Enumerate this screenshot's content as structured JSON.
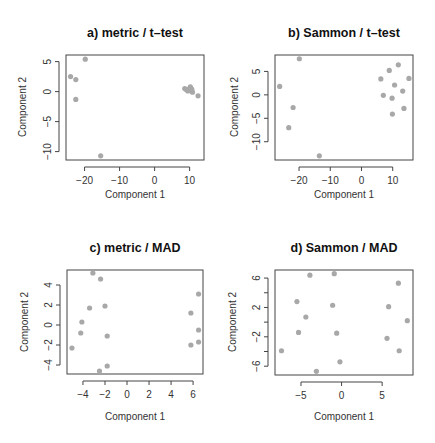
{
  "figure": {
    "background": "#ffffff",
    "point_color": "#a8a8a8",
    "axis_color": "#444444"
  },
  "chart_data": [
    {
      "type": "scatter",
      "title": "a) metric / t–test",
      "xlabel": "Component 1",
      "ylabel": "Component 2",
      "xticks": [
        -20,
        -10,
        0,
        10
      ],
      "xtick_labels": [
        "−20",
        "−10",
        "0",
        "10"
      ],
      "yticks": [
        5,
        0,
        -5,
        -10
      ],
      "ytick_labels": [
        "5",
        "0",
        "−5",
        "−10"
      ],
      "xlim": [
        -25.3,
        14.1
      ],
      "ylim": [
        -11.4,
        6.1
      ],
      "grid": false,
      "legend": null,
      "box": {
        "left": 66,
        "top": 55,
        "right": 204,
        "bottom": 160
      },
      "points": [
        {
          "x": -19.8,
          "y": 5.4
        },
        {
          "x": -24.0,
          "y": 2.5
        },
        {
          "x": -22.5,
          "y": 2.0
        },
        {
          "x": -22.5,
          "y": -1.3
        },
        {
          "x": -15.4,
          "y": -10.7
        },
        {
          "x": 8.6,
          "y": 0.5
        },
        {
          "x": 9.5,
          "y": 0.1
        },
        {
          "x": 10.2,
          "y": 0.8
        },
        {
          "x": 10.6,
          "y": 0.4
        },
        {
          "x": 9.8,
          "y": 0.4
        },
        {
          "x": 10.8,
          "y": -0.1
        },
        {
          "x": 12.4,
          "y": -0.7
        },
        {
          "x": 9.1,
          "y": 0.3
        }
      ]
    },
    {
      "type": "scatter",
      "title": "b) Sammon / t–test",
      "xlabel": "Component 1",
      "ylabel": "Component 2",
      "xticks": [
        -20,
        -10,
        0,
        10
      ],
      "xtick_labels": [
        "−20",
        "−10",
        "0",
        "10"
      ],
      "yticks": [
        5,
        0,
        -5,
        -10
      ],
      "ytick_labels": [
        "5",
        "0",
        "−5",
        "−10"
      ],
      "xlim": [
        -27.7,
        16.5
      ],
      "ylim": [
        -13.9,
        8.5
      ],
      "grid": false,
      "legend": null,
      "box": {
        "left": 275,
        "top": 55,
        "right": 413,
        "bottom": 160
      },
      "points": [
        {
          "x": -19.9,
          "y": 7.7
        },
        {
          "x": -26.2,
          "y": 1.8
        },
        {
          "x": -21.9,
          "y": -2.7
        },
        {
          "x": -23.3,
          "y": -7.0
        },
        {
          "x": -13.5,
          "y": -13.0
        },
        {
          "x": 11.8,
          "y": 6.4
        },
        {
          "x": 8.9,
          "y": 5.2
        },
        {
          "x": 6.2,
          "y": 3.4
        },
        {
          "x": 15.2,
          "y": 3.5
        },
        {
          "x": 10.6,
          "y": 2.1
        },
        {
          "x": 13.2,
          "y": 0.8
        },
        {
          "x": 7.0,
          "y": -0.1
        },
        {
          "x": 9.8,
          "y": -0.7
        },
        {
          "x": 13.6,
          "y": -2.9
        },
        {
          "x": 9.9,
          "y": -4.1
        }
      ]
    },
    {
      "type": "scatter",
      "title": "c) metric / MAD",
      "xlabel": "Component 1",
      "ylabel": "Component 2",
      "xticks": [
        -4,
        -2,
        0,
        2,
        4,
        6
      ],
      "xtick_labels": [
        "−4",
        "−2",
        "0",
        "2",
        "4",
        "6"
      ],
      "yticks": [
        4,
        2,
        0,
        -2,
        -4
      ],
      "ytick_labels": [
        "4",
        "2",
        "0",
        "−2",
        "−4"
      ],
      "xlim": [
        -5.45,
        6.9
      ],
      "ylim": [
        -4.9,
        5.5
      ],
      "grid": false,
      "legend": null,
      "box": {
        "left": 67,
        "top": 270,
        "right": 203,
        "bottom": 374
      },
      "points": [
        {
          "x": -3.1,
          "y": 5.2
        },
        {
          "x": -2.4,
          "y": 4.6
        },
        {
          "x": -3.4,
          "y": 1.7
        },
        {
          "x": -2.0,
          "y": 1.9
        },
        {
          "x": -4.1,
          "y": 0.3
        },
        {
          "x": -4.2,
          "y": -0.8
        },
        {
          "x": -1.8,
          "y": -1.1
        },
        {
          "x": -5.0,
          "y": -2.3
        },
        {
          "x": -1.8,
          "y": -4.1
        },
        {
          "x": -2.5,
          "y": -4.6
        },
        {
          "x": 6.5,
          "y": 3.1
        },
        {
          "x": 5.8,
          "y": 1.2
        },
        {
          "x": 6.5,
          "y": -0.5
        },
        {
          "x": 6.5,
          "y": -1.7
        },
        {
          "x": 5.8,
          "y": -2.0
        }
      ]
    },
    {
      "type": "scatter",
      "title": "d) Sammon / MAD",
      "xlabel": "Component 1",
      "ylabel": "Component 2",
      "xticks": [
        -5,
        0,
        5
      ],
      "xtick_labels": [
        "−5",
        "0",
        "5"
      ],
      "yticks": [
        6,
        4,
        2,
        0,
        -2,
        -4,
        -6
      ],
      "ytick_labels": [
        "6",
        "",
        "2",
        "",
        "−2",
        "",
        "−6"
      ],
      "xlim": [
        -8.2,
        8.8
      ],
      "ylim": [
        -7.2,
        7.1
      ],
      "grid": false,
      "legend": null,
      "box": {
        "left": 275,
        "top": 270,
        "right": 413,
        "bottom": 375
      },
      "points": [
        {
          "x": -3.9,
          "y": 6.4
        },
        {
          "x": -0.9,
          "y": 6.6
        },
        {
          "x": -5.5,
          "y": 2.8
        },
        {
          "x": -1.1,
          "y": 2.3
        },
        {
          "x": -4.4,
          "y": 0.7
        },
        {
          "x": -5.3,
          "y": -1.4
        },
        {
          "x": -0.6,
          "y": -1.5
        },
        {
          "x": -7.4,
          "y": -3.9
        },
        {
          "x": -0.2,
          "y": -5.4
        },
        {
          "x": -3.1,
          "y": -6.7
        },
        {
          "x": 7.0,
          "y": 5.3
        },
        {
          "x": 5.8,
          "y": 2.1
        },
        {
          "x": 8.1,
          "y": 0.2
        },
        {
          "x": 5.6,
          "y": -2.2
        },
        {
          "x": 7.1,
          "y": -3.9
        }
      ]
    }
  ]
}
